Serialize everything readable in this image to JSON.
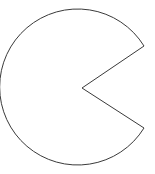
{
  "canvas": {
    "width": 155,
    "height": 174,
    "background_color": "#ffffff"
  },
  "figure": {
    "name": "pac-man-sector",
    "shape_type": "circular-sector-with-notch",
    "fill_color": "#ffffff",
    "stroke_color": "#3a3a3a",
    "stroke_width": 1
  },
  "geometry": {
    "center_x": 82,
    "center_y": 88,
    "radius": 78,
    "wedge_opening_side": "right",
    "wedge_upper_corner_x": 144,
    "wedge_upper_corner_y": 46,
    "wedge_lower_corner_x": 144,
    "wedge_lower_corner_y": 128,
    "wedge_half_angle_degrees": 34,
    "arc_sweep_degrees": 292,
    "bounds_left": 4,
    "bounds_top": 10,
    "bounds_right": 144,
    "bounds_bottom": 166,
    "path": "M 144 46 A 78 78 0 1 0 144 128 L 82 88 Z"
  }
}
